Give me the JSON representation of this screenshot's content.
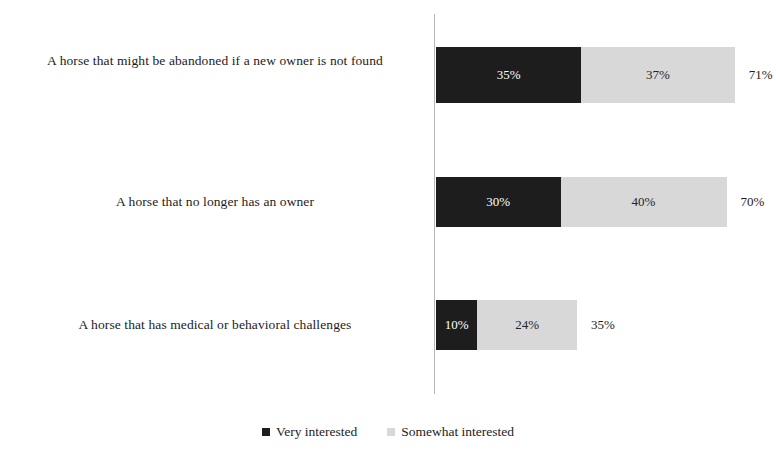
{
  "chart_data": {
    "type": "bar",
    "orientation": "horizontal",
    "stacked": true,
    "title": "",
    "subtitle": "",
    "xlabel": "",
    "ylabel": "",
    "grid": false,
    "axis_visible": true,
    "xlim": [
      0,
      100
    ],
    "legend_position": "bottom",
    "categories": [
      "A horse that might be abandoned if a new owner is not found",
      "A horse that no longer has an owner",
      "A horse that has medical or behavioral challenges"
    ],
    "series": [
      {
        "name": "Very interested",
        "color": "#1d1d1d",
        "values": [
          35,
          30,
          10
        ]
      },
      {
        "name": "Somewhat interested",
        "color": "#d8d8d8",
        "values": [
          37,
          40,
          24
        ]
      }
    ],
    "totals": [
      71,
      70,
      35
    ],
    "value_labels": [
      [
        "35%",
        "37%"
      ],
      [
        "30%",
        "40%"
      ],
      [
        "10%",
        "24%"
      ]
    ],
    "total_labels": [
      "71%",
      "70%",
      "35%"
    ]
  },
  "legend": {
    "items": [
      {
        "label": "Very interested",
        "swatch": "dark-square-icon"
      },
      {
        "label": "Somewhat interested",
        "swatch": "light-square-icon"
      }
    ]
  },
  "rows": [
    {
      "label": "A horse that might be abandoned if a new owner is not found",
      "dark_label": "35%",
      "light_label": "37%",
      "total_label": "71%"
    },
    {
      "label": "A horse that no longer has an owner",
      "dark_label": "30%",
      "light_label": "40%",
      "total_label": "70%"
    },
    {
      "label": "A horse that has medical or behavioral challenges",
      "dark_label": "10%",
      "light_label": "24%",
      "total_label": "35%"
    }
  ]
}
